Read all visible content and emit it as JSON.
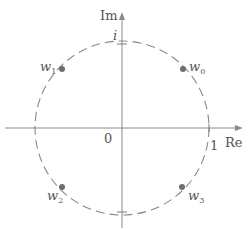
{
  "diagram": {
    "title": "",
    "axes": {
      "real_label": "Re",
      "imag_label": "Im",
      "origin_label": "0",
      "real_unit_label": "1",
      "imag_unit_label": "i"
    },
    "circle": {
      "style": "dashed",
      "radius_label": "1"
    },
    "points": [
      {
        "name": "w",
        "sub": "0",
        "angle_deg": 45
      },
      {
        "name": "w",
        "sub": "1",
        "angle_deg": 135
      },
      {
        "name": "w",
        "sub": "2",
        "angle_deg": 225
      },
      {
        "name": "w",
        "sub": "3",
        "angle_deg": 315
      }
    ],
    "colors": {
      "line": "#8a8a8a",
      "point": "#6e6e6e",
      "text": "#555555"
    }
  }
}
